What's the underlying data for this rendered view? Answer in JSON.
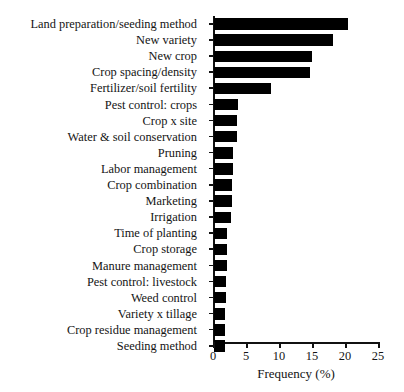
{
  "chart_data": {
    "type": "bar",
    "orientation": "horizontal",
    "title": "",
    "xlabel": "Frequency (%)",
    "ylabel": "",
    "xlim": [
      0,
      25
    ],
    "xticks": [
      0,
      5,
      10,
      15,
      20,
      25
    ],
    "grid": false,
    "legend": null,
    "bar_color": "#000000",
    "background_color": "#ffffff",
    "categories": [
      "Land preparation/seeding method",
      "New variety",
      "New crop",
      "Crop spacing/density",
      "Fertilizer/soil fertility",
      "Pest control: crops",
      "Crop x site",
      "Water & soil conservation",
      "Pruning",
      "Labor management",
      "Crop combination",
      "Marketing",
      "Irrigation",
      "Time of planting",
      "Crop storage",
      "Manure management",
      "Pest control: livestock",
      "Weed control",
      "Variety x tillage",
      "Crop residue management",
      "Seeding method"
    ],
    "values": [
      20.3,
      18.0,
      14.8,
      14.6,
      8.6,
      3.6,
      3.5,
      3.5,
      2.9,
      2.9,
      2.8,
      2.8,
      2.6,
      2.0,
      1.9,
      1.9,
      1.8,
      1.8,
      1.7,
      1.6,
      1.6
    ]
  }
}
